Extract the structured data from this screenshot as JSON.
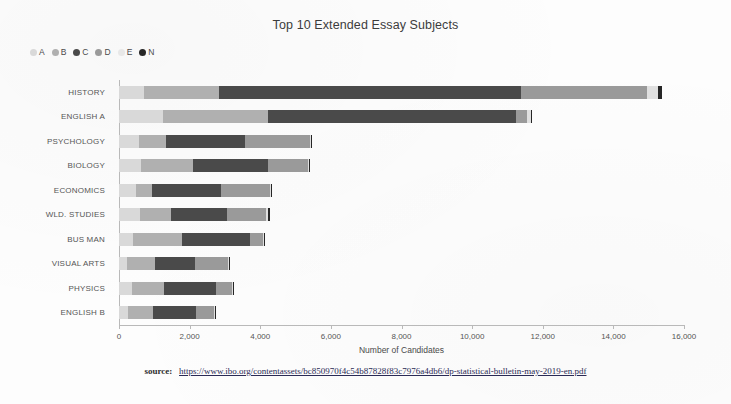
{
  "chart_data": {
    "type": "bar",
    "orientation": "horizontal",
    "stacked": true,
    "title": "Top 10 Extended Essay Subjects",
    "xlabel": "Number of Candidates",
    "ylabel": "",
    "xlim": [
      0,
      16000
    ],
    "xticks": [
      0,
      2000,
      4000,
      6000,
      8000,
      10000,
      12000,
      14000,
      16000
    ],
    "xtick_labels": [
      "0",
      "2,000",
      "4,000",
      "6,000",
      "8,000",
      "10,000",
      "12,000",
      "14,000",
      "16,000"
    ],
    "grid": false,
    "legend_position": "top-left",
    "categories": [
      "HISTORY",
      "ENGLISH A",
      "PSYCHOLOGY",
      "BIOLOGY",
      "ECONOMICS",
      "WLD. STUDIES",
      "BUS MAN",
      "VISUAL ARTS",
      "PHYSICS",
      "ENGLISH B"
    ],
    "series": [
      {
        "name": "A",
        "color": "#d9d9d9",
        "values": [
          700,
          1250,
          560,
          620,
          480,
          590,
          400,
          230,
          370,
          260
        ]
      },
      {
        "name": "B",
        "color": "#b0b0b0",
        "values": [
          2830,
          4210,
          1330,
          2090,
          940,
          1470,
          1780,
          1020,
          1270,
          960
        ]
      },
      {
        "name": "C",
        "color": "#4a4a4a",
        "values": [
          11380,
          11240,
          3570,
          4210,
          2890,
          3060,
          3700,
          2150,
          2740,
          2180
        ]
      },
      {
        "name": "D",
        "color": "#9a9a9a",
        "values": [
          14960,
          11560,
          5400,
          5340,
          4270,
          4160,
          4070,
          3080,
          3190,
          2690
        ]
      },
      {
        "name": "E",
        "color": "#e0e0e0",
        "values": [
          15270,
          11660,
          5440,
          5380,
          4300,
          4220,
          4110,
          3110,
          3220,
          2720
        ]
      },
      {
        "name": "N",
        "color": "#262626",
        "values": [
          15370,
          11710,
          5480,
          5420,
          4330,
          4270,
          4130,
          3150,
          3250,
          2740
        ]
      }
    ],
    "legend": [
      {
        "label": "A",
        "color": "#d9d9d9"
      },
      {
        "label": "B",
        "color": "#b0b0b0"
      },
      {
        "label": "C",
        "color": "#4a4a4a"
      },
      {
        "label": "D",
        "color": "#9a9a9a"
      },
      {
        "label": "E",
        "color": "#e8e8e8"
      },
      {
        "label": "N",
        "color": "#262626"
      }
    ]
  },
  "footer": {
    "source_label": "source:",
    "source_url": "https://www.ibo.org/contentassets/bc850970f4c54b87828f83c7976a4db6/dp-statistical-bulletin-may-2019-en.pdf"
  }
}
